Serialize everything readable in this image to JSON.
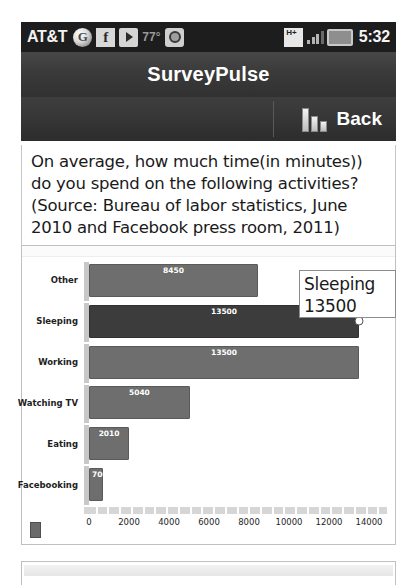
{
  "status_bar": {
    "carrier": "AT&T",
    "temperature": "77°",
    "network": "H+",
    "clock": "5:32",
    "icons": [
      "chrome-icon",
      "facebook-icon",
      "play-store-icon",
      "camera-icon",
      "hplus-network-icon",
      "signal-icon",
      "battery-icon"
    ]
  },
  "titlebar": {
    "app_title": "SurveyPulse"
  },
  "backbar": {
    "back_label": "Back"
  },
  "question": {
    "text": "On average, how much time(in minutes)) do you spend on the following activities? (Source: Bureau of labor statistics, June 2010 and Facebook press room, 2011)"
  },
  "tooltip": {
    "category": "Sleeping",
    "value": "13500"
  },
  "chart_data": {
    "type": "bar",
    "orientation": "horizontal",
    "title": "",
    "xlabel": "",
    "ylabel": "",
    "categories": [
      "Other",
      "Sleeping",
      "Working",
      "Watching TV",
      "Eating",
      "Facebooking"
    ],
    "values": [
      8450,
      13500,
      13500,
      5040,
      2010,
      700
    ],
    "value_labels": [
      "8450",
      "13500",
      "13500",
      "5040",
      "2010",
      "700"
    ],
    "xlim": [
      0,
      15000
    ],
    "xticks": [
      0,
      2000,
      4000,
      6000,
      8000,
      10000,
      12000,
      14000
    ],
    "xticklabels": [
      "0",
      "2000",
      "4000",
      "6000",
      "8000",
      "10000",
      "12000",
      "14000"
    ],
    "grid": false,
    "legend": false,
    "selected_index": 1,
    "colors": {
      "bar": "#6e6e6e",
      "bar_selected": "#3c3c3c",
      "axis": "#c8c8c8"
    }
  }
}
